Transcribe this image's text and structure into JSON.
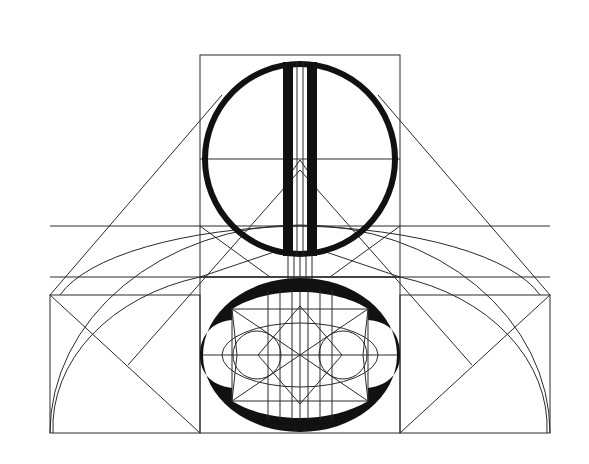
{
  "figure": {
    "title": "",
    "colors": {
      "background": "#ffffff",
      "stroke": "#2a2a2a",
      "fill": "#111111"
    }
  }
}
